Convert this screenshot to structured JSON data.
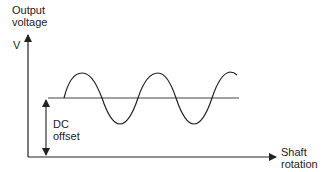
{
  "diagram": {
    "y_axis_label_line1": "Output",
    "y_axis_label_line2": "voltage",
    "y_axis_unit": "V",
    "x_axis_label_line1": "Shaft",
    "x_axis_label_line2": "rotation",
    "offset_label_line1": "DC",
    "offset_label_line2": "offset",
    "waveform": "sine",
    "line_color": "#222222"
  }
}
